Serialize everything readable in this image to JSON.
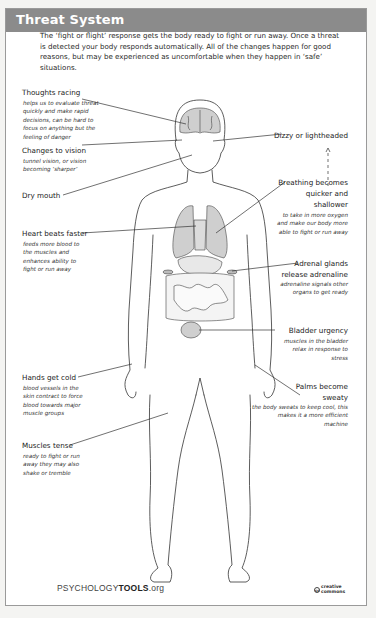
{
  "header": {
    "title": "Threat System",
    "bg_color": "#8b8b8b"
  },
  "intro": "The ‘fight or flight’ response gets the body ready to fight or run away. Once a threat is detected your body responds automatically. All of the changes happen for good reasons, but may be experienced as uncomfortable when they happen in ‘safe’ situations.",
  "annotations": {
    "thoughts": {
      "label": "Thoughts racing",
      "desc": "helps us to evaluate threat quickly and make rapid decisions, can be hard to focus on anything but the feeling of danger"
    },
    "vision": {
      "label": "Changes to vision",
      "desc": "tunnel vision, or vision becoming ‘sharper’"
    },
    "mouth": {
      "label": "Dry mouth"
    },
    "heart": {
      "label": "Heart beats faster",
      "desc": "feeds more blood to the muscles and enhances ability to fight or run away"
    },
    "hands": {
      "label": "Hands get cold",
      "desc": "blood vessels in the skin contract to force blood towards major muscle groups"
    },
    "muscles": {
      "label": "Muscles tense",
      "desc": "ready to fight or run away they may also shake or tremble"
    },
    "dizzy": {
      "label": "Dizzy or lightheaded"
    },
    "breathing": {
      "label_1": "Breathing becomes",
      "label_2": "quicker and",
      "label_3": "shallower",
      "desc": "to take in more oxygen and make our body more able to fight or run away"
    },
    "adrenal": {
      "label_1": "Adrenal glands",
      "label_2": "release adrenaline",
      "desc": "adrenaline signals other organs to get ready"
    },
    "bladder": {
      "label": "Bladder urgency",
      "desc": "muscles in the bladder relax in response to stress"
    },
    "palms": {
      "label_1": "Palms become",
      "label_2": "sweaty",
      "desc": "the body sweats to keep cool, this makes it a more efficient machine"
    }
  },
  "footer": {
    "logo_prefix": "PSYCHOLOGY",
    "logo_bold": "TOOLS",
    "logo_suffix": ".org",
    "license_1": "creative",
    "license_2": "commons",
    "license_icon": "cc"
  },
  "colors": {
    "organ_fill": "#cfcfcf",
    "outline": "#333333",
    "frame_border": "#9a9a9a"
  }
}
